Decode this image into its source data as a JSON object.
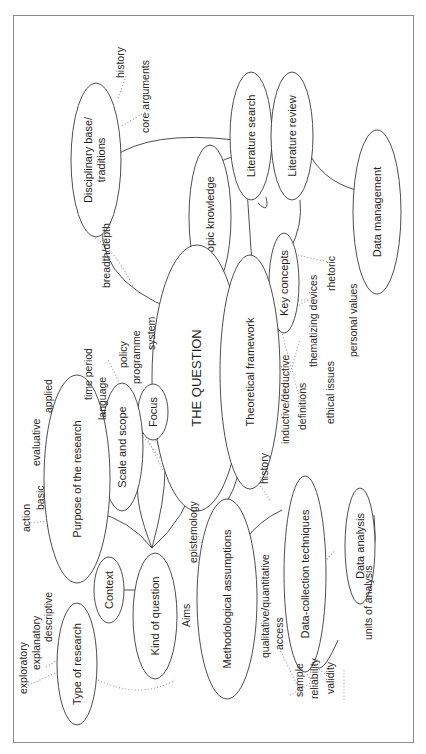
{
  "diagram": {
    "title": "THE QUESTION",
    "orientation": "rotated-90-ccw",
    "nodes": {
      "the_question": "THE QUESTION",
      "topic_knowledge": "Topic knowledge",
      "disciplinary_base_1": "Disciplinary base/",
      "disciplinary_base_2": "traditions",
      "literature_search": "Literature search",
      "literature_review": "Literature review",
      "data_management": "Data management",
      "key_concepts": "Key concepts",
      "theoretical_framework": "Theoretical framework",
      "focus": "Focus",
      "scale_and_scope": "Scale and scope",
      "purpose_of_research": "Purpose of the research",
      "context": "Context",
      "kind_of_question": "Kind of question",
      "type_of_research": "Type of research",
      "methodological_assumptions": "Methodological assumptions",
      "data_collection_techniques": "Data-collection techniques",
      "data_analysis": "Data analysis"
    },
    "labels": {
      "history_top": "history",
      "core_arguments": "core arguments",
      "breadth_depth": "breadth/depth",
      "policy": "policy",
      "programme": "programme",
      "system": "system",
      "time_period": "time period",
      "language": "language",
      "applied": "applied",
      "evaluative": "evaluative",
      "basic": "basic",
      "action": "action",
      "exploratory": "exploratory",
      "explanatory": "explanatory",
      "descriptive": "descriptive",
      "aims": "Aims",
      "epistemology": "epistemology",
      "history_mid": "history",
      "inductive_deductive": "inductive/deductive",
      "definitions": "definitions",
      "thematizing_devices": "thematizing devices",
      "rhetoric": "rhetoric",
      "ethical_issues": "ethical issues",
      "personal_values": "personal values",
      "qualitative_quantitative": "qualitative/quantitative",
      "access": "access",
      "sample": "sample",
      "reliability": "reliability",
      "validity": "validity",
      "units_of_analysis": "units of analysis"
    }
  }
}
